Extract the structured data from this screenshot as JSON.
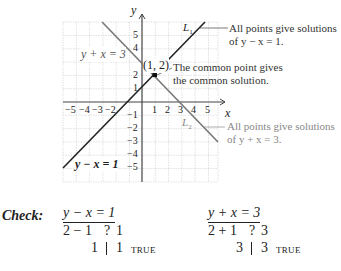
{
  "graph": {
    "x_axis_label": "x",
    "y_axis_label": "y",
    "x_ticks": [
      "−5",
      "−4",
      "−3",
      "−2",
      "1",
      "2",
      "3",
      "4",
      "5"
    ],
    "y_ticks": [
      "5",
      "4",
      "2",
      "1",
      "−1",
      "−2",
      "−3",
      "−4",
      "−5"
    ],
    "line1": {
      "name": "L",
      "sub": "1",
      "equation": "y − x = 1",
      "color": "#222222"
    },
    "line2": {
      "name": "L",
      "sub": "2",
      "equation": "y + x = 3",
      "color": "#777777"
    },
    "intersection_label": "(1, 2)",
    "annotations": {
      "line1_a": "All points give solutions",
      "line1_b": "of y − x = 1.",
      "common_a": "The common point gives",
      "common_b": "the common solution.",
      "line2_a": "All points give solutions",
      "line2_b": "of y + x = 3."
    }
  },
  "check": {
    "label": "Check:",
    "left": {
      "equation": "y − x = 1",
      "sub_lhs": "2 − 1",
      "q": "?",
      "sub_rhs": "1",
      "res_lhs": "1",
      "res_rhs": "1",
      "verdict": "TRUE"
    },
    "right": {
      "equation": "y + x = 3",
      "sub_lhs": "2 + 1",
      "q": "?",
      "sub_rhs": "3",
      "res_lhs": "3",
      "res_rhs": "3",
      "verdict": "TRUE"
    }
  },
  "footer_partial": "We ... (cut off)"
}
